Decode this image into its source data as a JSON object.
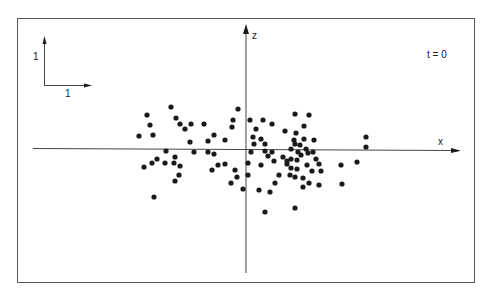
{
  "figure": {
    "time_label": "t = 0",
    "axis_x_label": "x",
    "axis_z_label": "z",
    "scale_bar": {
      "vertical_label": "1",
      "horizontal_label": "1"
    },
    "colors": {
      "ink": "#1a1a1a",
      "axis": "#444444",
      "frame": "#555555",
      "background": "#ffffff"
    }
  },
  "chart_data": {
    "type": "scatter",
    "title": "t = 0",
    "xlabel": "x",
    "ylabel": "z",
    "grid": false,
    "legend": null,
    "annotations": [
      "t = 0",
      "scale bar: 1 (vertical), 1 (horizontal)"
    ],
    "units_note": "Coordinates in pixel space of the 491x297 figure; origin of axes at (246,149), y increases downward. One scale unit ≈ 48 px.",
    "origin_px": [
      246,
      149
    ],
    "unit_px": 48,
    "points_px": [
      [
        171,
        107
      ],
      [
        147,
        115
      ],
      [
        150,
        125
      ],
      [
        139,
        136
      ],
      [
        153,
        135
      ],
      [
        176,
        118
      ],
      [
        180,
        124
      ],
      [
        185,
        129
      ],
      [
        166,
        151
      ],
      [
        157,
        159
      ],
      [
        152,
        163
      ],
      [
        144,
        167
      ],
      [
        165,
        163
      ],
      [
        175,
        157
      ],
      [
        174,
        163
      ],
      [
        180,
        166
      ],
      [
        179,
        175
      ],
      [
        175,
        181
      ],
      [
        154,
        197
      ],
      [
        238,
        109
      ],
      [
        233,
        120
      ],
      [
        232,
        127
      ],
      [
        191,
        124
      ],
      [
        204,
        124
      ],
      [
        214,
        135
      ],
      [
        208,
        141
      ],
      [
        190,
        142
      ],
      [
        225,
        140
      ],
      [
        194,
        152
      ],
      [
        208,
        152
      ],
      [
        214,
        154
      ],
      [
        218,
        165
      ],
      [
        225,
        164
      ],
      [
        212,
        170
      ],
      [
        235,
        170
      ],
      [
        237,
        177
      ],
      [
        231,
        183
      ],
      [
        243,
        189
      ],
      [
        250,
        120
      ],
      [
        263,
        120
      ],
      [
        272,
        124
      ],
      [
        256,
        129
      ],
      [
        253,
        137
      ],
      [
        261,
        139
      ],
      [
        254,
        144
      ],
      [
        265,
        144
      ],
      [
        285,
        131
      ],
      [
        251,
        152
      ],
      [
        265,
        151
      ],
      [
        272,
        152
      ],
      [
        268,
        156
      ],
      [
        274,
        161
      ],
      [
        248,
        163
      ],
      [
        261,
        165
      ],
      [
        283,
        157
      ],
      [
        248,
        175
      ],
      [
        279,
        175
      ],
      [
        275,
        183
      ],
      [
        259,
        190
      ],
      [
        270,
        192
      ],
      [
        265,
        212
      ],
      [
        295,
        208
      ],
      [
        295,
        114
      ],
      [
        309,
        115
      ],
      [
        304,
        126
      ],
      [
        296,
        133
      ],
      [
        294,
        140
      ],
      [
        295,
        144
      ],
      [
        304,
        139
      ],
      [
        314,
        140
      ],
      [
        300,
        145
      ],
      [
        291,
        149
      ],
      [
        306,
        149
      ],
      [
        313,
        152
      ],
      [
        298,
        152
      ],
      [
        301,
        155
      ],
      [
        308,
        153
      ],
      [
        297,
        160
      ],
      [
        287,
        161
      ],
      [
        291,
        159
      ],
      [
        287,
        164
      ],
      [
        316,
        159
      ],
      [
        307,
        165
      ],
      [
        319,
        164
      ],
      [
        291,
        168
      ],
      [
        297,
        169
      ],
      [
        290,
        175
      ],
      [
        295,
        177
      ],
      [
        312,
        171
      ],
      [
        321,
        171
      ],
      [
        303,
        178
      ],
      [
        309,
        183
      ],
      [
        303,
        187
      ],
      [
        319,
        185
      ],
      [
        366,
        137
      ],
      [
        366,
        147
      ],
      [
        357,
        162
      ],
      [
        341,
        165
      ],
      [
        342,
        184
      ]
    ]
  }
}
